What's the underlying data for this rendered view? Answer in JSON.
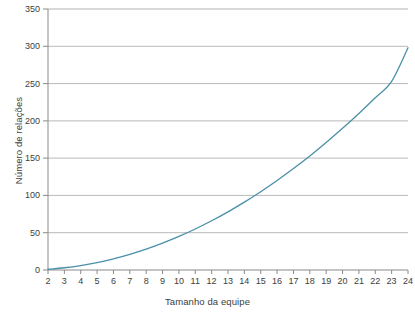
{
  "chart_data": {
    "type": "line",
    "title": "",
    "xlabel": "Tamanho da equipe",
    "ylabel": "Número de relações",
    "xlim": [
      2,
      24
    ],
    "ylim": [
      0,
      350
    ],
    "grid": true,
    "legend": null,
    "line_color": "#4a8fa8",
    "grid_color": "#b3b3b3",
    "x_tick_labels": [
      "2",
      "3",
      "4",
      "5",
      "6",
      "7",
      "8",
      "9",
      "10",
      "11",
      "12",
      "13",
      "14",
      "15",
      "16",
      "17",
      "18",
      "19",
      "20",
      "21",
      "22",
      "23",
      "24"
    ],
    "y_tick_labels": [
      "0",
      "50",
      "100",
      "150",
      "200",
      "250",
      "300",
      "350"
    ],
    "x": [
      2,
      3,
      4,
      5,
      6,
      7,
      8,
      9,
      10,
      11,
      12,
      13,
      14,
      15,
      16,
      17,
      18,
      19,
      20,
      21,
      22,
      23,
      24
    ],
    "values": [
      1,
      3,
      6,
      10,
      15,
      21,
      28,
      36,
      45,
      55,
      66,
      78,
      91,
      105,
      120,
      136,
      153,
      171,
      190,
      210,
      231,
      253,
      298
    ],
    "series": [
      {
        "name": "Número de relações",
        "values": [
          1,
          3,
          6,
          10,
          15,
          21,
          28,
          36,
          45,
          55,
          66,
          78,
          91,
          105,
          120,
          136,
          153,
          171,
          190,
          210,
          231,
          253,
          298
        ]
      }
    ]
  },
  "figure": {
    "background_color": "#ffffff",
    "axis_text_color": "#3d3d3d"
  }
}
